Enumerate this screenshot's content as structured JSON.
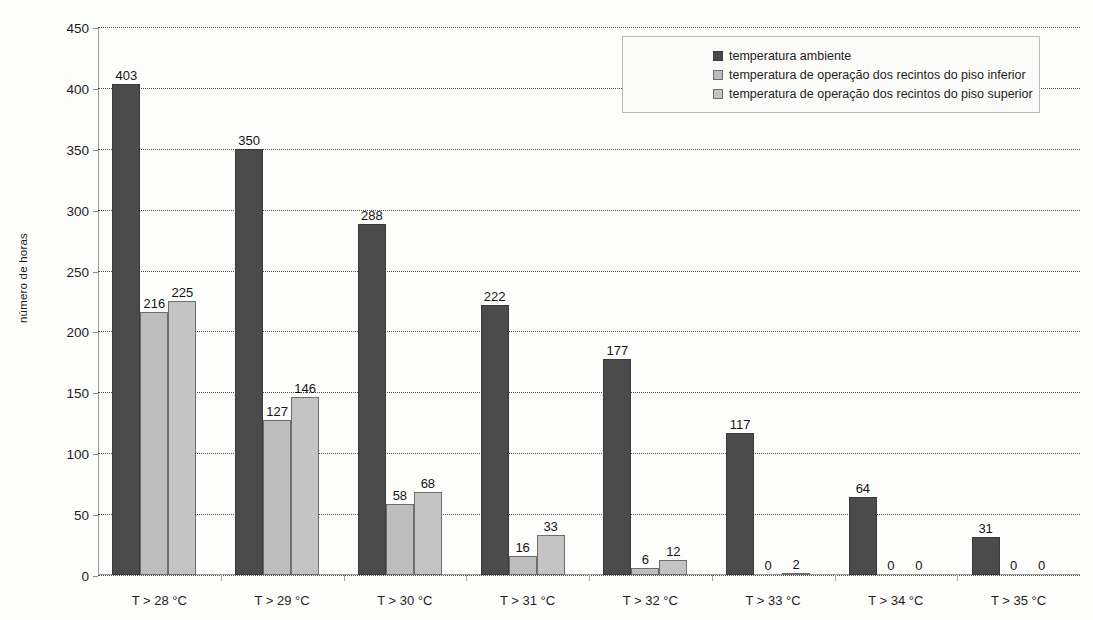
{
  "chart_data": {
    "type": "bar",
    "title": "",
    "xlabel": "",
    "ylabel": "número de horas",
    "ylim": [
      0,
      450
    ],
    "ytick_step": 50,
    "yticks": [
      "450",
      "400",
      "350",
      "300",
      "250",
      "200",
      "150",
      "100",
      "50",
      "0"
    ],
    "grid": true,
    "legend_position": "top-right",
    "categories": [
      "T > 28 °C",
      "T > 29 °C",
      "T > 30 °C",
      "T > 31 °C",
      "T > 32 °C",
      "T > 33 °C",
      "T > 34 °C",
      "T > 35 °C"
    ],
    "series": [
      {
        "name": "temperatura ambiente",
        "color": "#4b4b4b",
        "values": [
          403,
          350,
          288,
          222,
          177,
          117,
          64,
          31
        ]
      },
      {
        "name": "temperatura de operação dos recintos do piso inferior",
        "color": "#bdbdbd",
        "values": [
          216,
          127,
          58,
          16,
          6,
          0,
          0,
          0
        ]
      },
      {
        "name": "temperatura de operação dos recintos do piso superior",
        "color": "#c4c4c4",
        "values": [
          225,
          146,
          68,
          33,
          12,
          2,
          0,
          0
        ]
      }
    ]
  }
}
